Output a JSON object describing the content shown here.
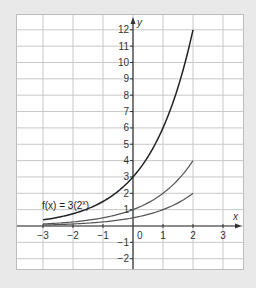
{
  "chart_data": {
    "type": "line",
    "title": "",
    "xlabel": "x",
    "ylabel": "y",
    "xlim": [
      -3,
      3
    ],
    "ylim": [
      -2,
      12
    ],
    "grid": true,
    "x_ticks": [
      "-3",
      "-2",
      "-1",
      "0",
      "1",
      "2",
      "3"
    ],
    "y_ticks": [
      "-2",
      "-1",
      "1",
      "2",
      "3",
      "4",
      "5",
      "6",
      "7",
      "8",
      "9",
      "10",
      "11",
      "12"
    ],
    "origin_label": "0",
    "annotation": {
      "text_prefix": "f(x) = 3(2",
      "exponent": "x",
      "text_suffix": ")",
      "x": -3,
      "y": 0.8
    },
    "series": [
      {
        "name": "f(x) = 3(2^x)",
        "color": "#222222",
        "x_range": [
          -3,
          2
        ],
        "coef": 3,
        "x": [
          -3,
          -2,
          -1,
          0,
          1,
          2
        ],
        "values": [
          0.375,
          0.75,
          1.5,
          3,
          6,
          12
        ]
      },
      {
        "name": "2^x",
        "color": "#555555",
        "x_range": [
          -3,
          2
        ],
        "coef": 1,
        "x": [
          -3,
          -2,
          -1,
          0,
          1,
          2
        ],
        "values": [
          0.125,
          0.25,
          0.5,
          1,
          2,
          4
        ]
      },
      {
        "name": "0.5(2^x)",
        "color": "#555555",
        "x_range": [
          -3,
          2
        ],
        "coef": 0.5,
        "x": [
          -3,
          -2,
          -1,
          0,
          1,
          2
        ],
        "values": [
          0.0625,
          0.125,
          0.25,
          0.5,
          1,
          2
        ]
      }
    ]
  },
  "colors": {
    "background": "#e9e9e9",
    "panel": "#ffffff",
    "grid": "#c8c8c8",
    "axis": "#333333"
  }
}
